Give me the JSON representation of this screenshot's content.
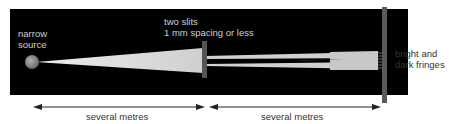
{
  "labels": {
    "source_line1": "narrow",
    "source_line2": "source",
    "slits_line1": "two slits",
    "slits_line2": "1 mm spacing or less",
    "fringes_line1": "bright and",
    "fringes_line2": "dark fringes",
    "distance_left": "several metres",
    "distance_right": "several metres"
  },
  "colors": {
    "background_box": "#000000",
    "beam": "#d9d9d9",
    "slit_plate": "#555555",
    "screen": "#555555",
    "arrow": "#222222"
  }
}
